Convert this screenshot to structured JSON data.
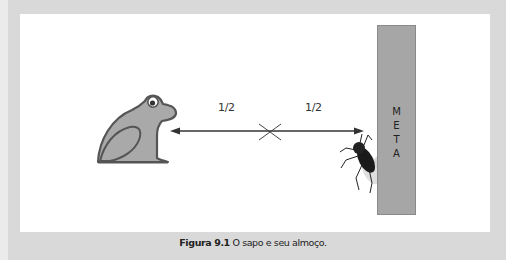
{
  "figure": {
    "caption_label": "Figura 9.1",
    "caption_text": " O sapo e seu almoço.",
    "distance_labels": [
      "1/2",
      "1/2"
    ],
    "goal_label_letters": [
      "M",
      "E",
      "T",
      "A"
    ],
    "elements": {
      "left": "frog-icon",
      "right": "fly-icon",
      "midpoint_marker": "x-mark",
      "goal": "meta-bar"
    },
    "colors": {
      "background": "#d9d9d9",
      "panel": "#ffffff",
      "frog_fill": "#a9a9a9",
      "frog_outline": "#555555",
      "meta_bar": "#a6a6a6",
      "arrow": "#333333"
    }
  }
}
